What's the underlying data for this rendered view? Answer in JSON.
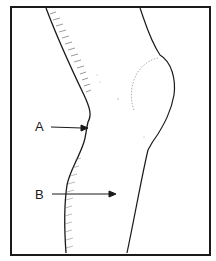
{
  "figure": {
    "type": "anatomical line drawing",
    "labels": [
      {
        "id": "A",
        "text": "A",
        "target": "notch at back of knee (popliteal region)"
      },
      {
        "id": "B",
        "text": "B",
        "target": "calf / lower leg"
      }
    ]
  },
  "colors": {
    "ink": "#1a1a1a",
    "hatch": "#555555",
    "background": "#ffffff"
  }
}
